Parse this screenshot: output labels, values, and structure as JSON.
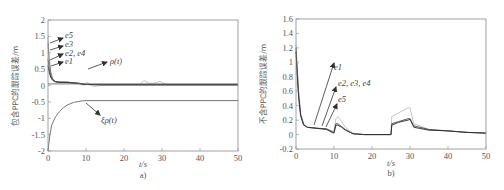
{
  "chart_data": [
    {
      "panel": "a)",
      "type": "line",
      "title": "",
      "caption": "a)",
      "xlabel": "t/s",
      "ylabel": "包含PPC的跟踪误差/m",
      "xlim": [
        0,
        50
      ],
      "ylim": [
        -2,
        2
      ],
      "xticks": [
        0,
        10,
        20,
        30,
        40,
        50
      ],
      "yticks": [
        2,
        1.5,
        1,
        0.5,
        0,
        -0.5,
        -1,
        -1.5,
        -2
      ],
      "ytick_labels": [
        "2",
        "1.5",
        "1",
        "0.5",
        "0",
        "-0.5",
        "-1",
        "-1.5",
        "-2"
      ],
      "grid": false,
      "annotations": [
        "e5",
        "e3",
        "e2, e4",
        "e1",
        "ρ(t)",
        "ξρ(t)"
      ],
      "series": [
        {
          "name": "e5",
          "x": [
            0,
            0.3,
            0.7,
            1.2,
            2,
            3,
            5,
            8,
            9.5,
            10.3,
            11,
            12,
            15,
            20,
            24,
            25.3,
            26.5,
            28,
            29.5,
            31,
            35,
            50
          ],
          "y": [
            1.48,
            0.9,
            0.45,
            0.22,
            0.12,
            0.1,
            0.1,
            0.06,
            0,
            0.1,
            0.05,
            -0.03,
            0.02,
            0.03,
            0.03,
            0.15,
            0.07,
            0.07,
            0.13,
            0.03,
            0.02,
            0.02
          ]
        },
        {
          "name": "e3",
          "x": [
            0,
            0.3,
            0.7,
            1.2,
            2,
            3,
            5,
            8,
            10,
            15,
            50
          ],
          "y": [
            1.3,
            0.8,
            0.4,
            0.2,
            0.12,
            0.1,
            0.1,
            0.07,
            0.03,
            0.02,
            0.02
          ]
        },
        {
          "name": "e2, e4",
          "x": [
            0,
            0.3,
            0.7,
            1.2,
            2,
            3,
            5,
            8,
            10,
            15,
            50
          ],
          "y": [
            0.8,
            0.55,
            0.3,
            0.18,
            0.12,
            0.1,
            0.1,
            0.07,
            0.03,
            0.02,
            0.02
          ]
        },
        {
          "name": "e1",
          "x": [
            0,
            0.3,
            0.7,
            1.2,
            2,
            3,
            5,
            8,
            10,
            15,
            50
          ],
          "y": [
            0.6,
            0.42,
            0.25,
            0.16,
            0.11,
            0.1,
            0.09,
            0.06,
            0.03,
            0.02,
            0.02
          ]
        },
        {
          "name": "ρ(t)",
          "x": [
            0,
            10,
            50
          ],
          "y": [
            0.05,
            0.05,
            0.05
          ]
        },
        {
          "name": "ξρ(t)",
          "x": [
            0,
            0.5,
            1,
            2,
            3,
            4,
            5,
            6,
            7,
            8,
            9,
            10,
            50
          ],
          "y": [
            -2,
            -1.5,
            -1.2,
            -0.95,
            -0.8,
            -0.68,
            -0.6,
            -0.55,
            -0.51,
            -0.49,
            -0.47,
            -0.46,
            -0.46
          ]
        }
      ]
    },
    {
      "panel": "b)",
      "type": "line",
      "title": "",
      "caption": "b)",
      "xlabel": "t/s",
      "ylabel": "不含PPC的跟踪误差/m",
      "xlim": [
        0,
        50
      ],
      "ylim": [
        -0.2,
        1.6
      ],
      "xticks": [
        0,
        10,
        20,
        30,
        40,
        50
      ],
      "yticks": [
        1.6,
        1.4,
        1.2,
        1,
        0.8,
        0.6,
        0.4,
        0.2,
        0,
        -0.2
      ],
      "ytick_labels": [
        "1.6",
        "1.4",
        "1.2",
        "1",
        "0.8",
        "0.6",
        "0.4",
        "0.2",
        "0",
        "-0.2"
      ],
      "grid": false,
      "annotations": [
        "e1",
        "e2, e3, e4",
        "e5"
      ],
      "series": [
        {
          "name": "e5",
          "x": [
            0,
            0.3,
            0.7,
            1.2,
            2,
            3,
            5,
            8,
            9.5,
            10,
            10.5,
            11,
            12,
            13,
            15,
            18,
            25,
            25.2,
            27,
            29.5,
            30,
            31,
            35,
            40,
            45,
            50
          ],
          "y": [
            1.25,
            0.95,
            0.6,
            0.3,
            0.15,
            0.1,
            0.09,
            0.08,
            0.05,
            0.05,
            0.22,
            0.25,
            0.18,
            0.1,
            0.02,
            0.0,
            0.0,
            0.25,
            0.3,
            0.37,
            0.37,
            0.15,
            0.07,
            0.05,
            0.03,
            0.02
          ]
        },
        {
          "name": "e2, e3, e4",
          "x": [
            0,
            0.3,
            0.7,
            1.2,
            2,
            3,
            5,
            8,
            9.5,
            10,
            10.5,
            11,
            12,
            13,
            15,
            18,
            25,
            25.2,
            27,
            29.5,
            30,
            31,
            35,
            40,
            45,
            50
          ],
          "y": [
            1.2,
            0.9,
            0.55,
            0.28,
            0.14,
            0.1,
            0.09,
            0.08,
            0.04,
            0.03,
            0.15,
            0.15,
            0.11,
            0.07,
            0.01,
            0.0,
            0.0,
            0.15,
            0.18,
            0.22,
            0.22,
            0.12,
            0.07,
            0.05,
            0.03,
            0.02
          ]
        },
        {
          "name": "e1",
          "x": [
            0,
            0.3,
            0.7,
            1.2,
            2,
            3,
            5,
            8,
            9.5,
            10,
            10.5,
            11,
            12,
            13,
            15,
            18,
            25,
            25.2,
            27,
            29.5,
            30,
            31,
            35,
            40,
            45,
            50
          ],
          "y": [
            1.15,
            0.85,
            0.5,
            0.26,
            0.13,
            0.1,
            0.09,
            0.07,
            0.03,
            0.02,
            0.13,
            0.13,
            0.1,
            0.06,
            0.01,
            0.0,
            0.0,
            0.13,
            0.17,
            0.2,
            0.21,
            0.1,
            0.06,
            0.05,
            0.03,
            0.02
          ]
        }
      ]
    }
  ]
}
